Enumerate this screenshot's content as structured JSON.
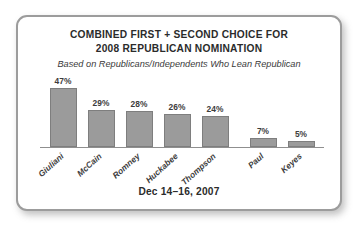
{
  "card": {
    "title_line_1": "COMBINED FIRST + SECOND CHOICE FOR",
    "title_line_2": "2008 REPUBLICAN NOMINATION",
    "subtitle": "Based on Republicans/Independents Who Lean Republican",
    "footer_date": "Dec 14–16, 2007",
    "border_color": "#9c9c9c",
    "background_color": "#ffffff"
  },
  "chart_data": {
    "type": "bar",
    "title": "COMBINED FIRST + SECOND CHOICE FOR 2008 REPUBLICAN NOMINATION",
    "subtitle": "Based on Republicans/Independents Who Lean Republican",
    "annotation": "Dec 14–16, 2007",
    "categories": [
      "Giuliani",
      "McCain",
      "Romney",
      "Huckabee",
      "Thompson",
      "Paul",
      "Keyes"
    ],
    "values": [
      47,
      29,
      28,
      26,
      24,
      7,
      5
    ],
    "value_labels": [
      "47%",
      "29%",
      "28%",
      "26%",
      "24%",
      "7%",
      "5%"
    ],
    "xlabel": "",
    "ylabel": "",
    "ylim": [
      0,
      55
    ],
    "grid": false,
    "legend": false,
    "bar_color": "#9b9b9b",
    "bar_border_color": "#7e7e7e",
    "axis_color": "#8f8f8f",
    "group_break_after_index": 4
  }
}
